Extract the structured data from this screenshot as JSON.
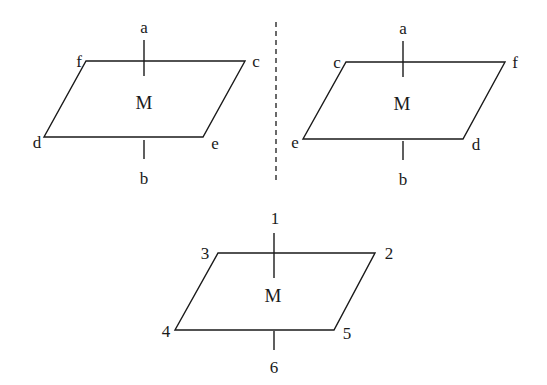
{
  "diagram": {
    "type": "molecule-mirror-image-planes",
    "figures": [
      {
        "id": "left",
        "center_label": "M",
        "labels": {
          "top": "a",
          "bottom": "b",
          "top_left": "f",
          "top_right": "c",
          "bottom_left": "d",
          "bottom_right": "e"
        }
      },
      {
        "id": "right",
        "center_label": "M",
        "labels": {
          "top": "a",
          "bottom": "b",
          "top_left": "c",
          "top_right": "f",
          "bottom_left": "e",
          "bottom_right": "d"
        }
      },
      {
        "id": "bottom",
        "center_label": "M",
        "labels": {
          "top": "1",
          "bottom": "6",
          "top_left": "3",
          "top_right": "2",
          "bottom_left": "4",
          "bottom_right": "5"
        }
      }
    ],
    "mirror_line": "dashed vertical"
  },
  "colors": {
    "ink": "#1a1a1a",
    "background": "#ffffff"
  }
}
